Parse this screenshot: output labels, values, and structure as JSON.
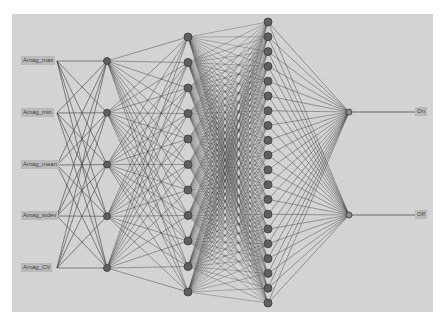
{
  "diagram": {
    "type": "neural-network",
    "background": "#d3d3d3",
    "edge_color": "#3c3c3c",
    "node_color": "#5f5f5f",
    "node_stroke": "#3a3a3a",
    "output_node_color": "#8a8a8a",
    "label_bg": "#b9b9b9",
    "inputs": [
      {
        "label": "Amag_max",
        "x": 37,
        "y": 61
      },
      {
        "label": "Amag_min",
        "x": 37,
        "y": 113
      },
      {
        "label": "Amag_mean",
        "x": 37,
        "y": 165
      },
      {
        "label": "Amag_stdev",
        "x": 37,
        "y": 216
      },
      {
        "label": "Amag_CV",
        "x": 37,
        "y": 268
      }
    ],
    "layers": [
      {
        "name": "hidden-1",
        "x": 107,
        "count": 5,
        "y_start": 61,
        "y_end": 268,
        "r": 3.5
      },
      {
        "name": "hidden-2",
        "x": 188,
        "count": 11,
        "y_start": 37,
        "y_end": 292,
        "r": 4
      },
      {
        "name": "hidden-3",
        "x": 268,
        "count": 20,
        "y_start": 22,
        "y_end": 303,
        "r": 4
      },
      {
        "name": "output",
        "x": 349,
        "count": 2,
        "y_start": 112,
        "y_end": 215,
        "r": 3
      }
    ],
    "outputs": [
      {
        "label": "On",
        "x": 421,
        "y": 112
      },
      {
        "label": "Off",
        "x": 421,
        "y": 215
      }
    ]
  }
}
